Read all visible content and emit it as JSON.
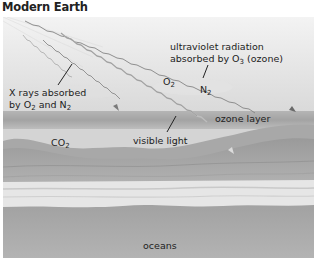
{
  "title": "Modern Earth",
  "labels": {
    "uv_line1": "ultraviolet radiation",
    "uv_line2_prefix": "absorbed by O",
    "uv_line2_sub": "3",
    "uv_line2_suffix": " (ozone)",
    "xray_line1": "X rays absorbed",
    "xray_line2_prefix": "by O",
    "xray_line2_sub1": "2",
    "xray_line2_mid": " and N",
    "xray_line2_sub2": "2",
    "o2_prefix": "O",
    "o2_sub": "2",
    "n2_prefix": "N",
    "n2_sub": "2",
    "co2_prefix": "CO",
    "co2_sub": "2",
    "ozone_layer": "ozone layer",
    "visible_light": "visible light",
    "oceans": "oceans"
  },
  "colors": {
    "sky_top": "#f2f2f2",
    "sky_bottom": "#dcdcdc",
    "ozone_band": "#a9a9a9",
    "lower_air": "#d2d2d2",
    "hills": "#8f8f8f",
    "surf": "#e8e8e8",
    "ocean": "#a5a5a5",
    "ray": "#8a8a8a"
  }
}
